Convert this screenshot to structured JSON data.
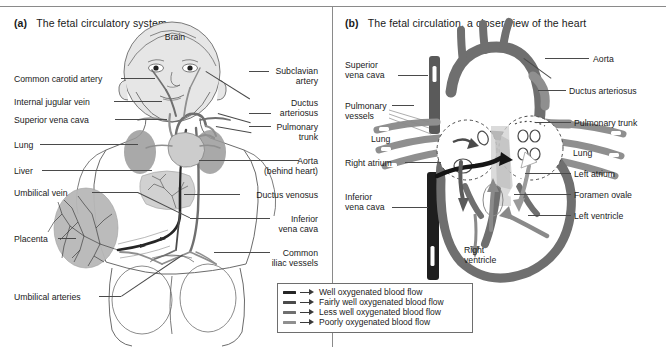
{
  "figure": {
    "panels": [
      {
        "tag": "(a)",
        "title": "The fetal circulatory system"
      },
      {
        "tag": "(b)",
        "title": "The fetal circulation, a closer view of the heart"
      }
    ]
  },
  "panel_a": {
    "inline_labels": [
      {
        "text": "Brain"
      }
    ],
    "left_labels": [
      {
        "text": "Common carotid artery"
      },
      {
        "text": "Internal jugular vein"
      },
      {
        "text": "Superior vena cava"
      },
      {
        "text": "Lung"
      },
      {
        "text": "Liver"
      },
      {
        "text": "Umbilical vein"
      },
      {
        "text": "Placenta"
      },
      {
        "text": "Umbilical arteries"
      }
    ],
    "right_labels": [
      {
        "line1": "Subclavian",
        "line2": "artery"
      },
      {
        "line1": "Ductus",
        "line2": "arteriosus"
      },
      {
        "line1": "Pulmonary",
        "line2": "trunk"
      },
      {
        "line1": "Aorta",
        "line2": "(behind heart)"
      },
      {
        "line1": "Ductus venosus",
        "line2": ""
      },
      {
        "line1": "Inferior",
        "line2": "vena cava"
      },
      {
        "line1": "Common",
        "line2": "iliac vessels"
      }
    ]
  },
  "panel_b": {
    "left_labels": [
      {
        "line1": "Superior",
        "line2": "vena cava"
      },
      {
        "line1": "Pulmonary",
        "line2": "vessels"
      },
      {
        "line1": "Lung",
        "line2": ""
      },
      {
        "line1": "Right atrium",
        "line2": ""
      },
      {
        "line1": "Inferior",
        "line2": "vena cava"
      }
    ],
    "right_labels": [
      {
        "text": "Aorta"
      },
      {
        "text": "Ductus arteriosus"
      },
      {
        "text": "Pulmonary trunk"
      },
      {
        "text": "Lung"
      },
      {
        "text": "Left atrium"
      },
      {
        "text": "Foramen ovale"
      },
      {
        "text": "Left ventricle"
      }
    ],
    "bottom_labels": [
      {
        "line1": "Right",
        "line2": "ventricle"
      }
    ]
  },
  "legend": {
    "entries": [
      {
        "label": "Well oxygenated blood flow",
        "color": "#252525"
      },
      {
        "label": "Fairly well oxygenated blood flow",
        "color": "#4a4a4a"
      },
      {
        "label": "Less well oxygenated blood flow",
        "color": "#6f6f6f"
      },
      {
        "label": "Poorly oxygenated blood flow",
        "color": "#8f8f8f"
      }
    ]
  },
  "style": {
    "blood_well": "#252525",
    "blood_fairly": "#4a4a4a",
    "blood_less": "#6f6f6f",
    "blood_poor": "#8f8f8f",
    "outline": "#555555",
    "leader": "#4a4a4a",
    "organ_fill": "#c9c9c9",
    "background": "#ffffff"
  }
}
